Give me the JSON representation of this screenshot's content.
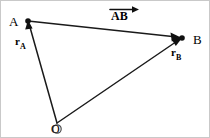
{
  "figure": {
    "type": "vector-diagram",
    "background_color": "#ffffff",
    "stroke_color": "#000000",
    "border_color": "#c9c9c9",
    "width": 210,
    "height": 138,
    "labels": {
      "point_a": "A",
      "point_b": "B",
      "origin": "O",
      "vector_ra_symbol": "r",
      "vector_ra_subscript": "A",
      "vector_rb_symbol": "r",
      "vector_rb_subscript": "B",
      "vector_ab": "AB"
    },
    "points": [
      {
        "name": "A",
        "label": "A",
        "x": 27,
        "y": 20,
        "marker": "filled-dot"
      },
      {
        "name": "B",
        "label": "B",
        "x": 181,
        "y": 37,
        "marker": "filled-dot"
      },
      {
        "name": "O",
        "label": "O",
        "x": 56,
        "y": 122,
        "marker": "open-circle"
      }
    ],
    "vectors": [
      {
        "name": "r_A",
        "label": "rA",
        "from": "O",
        "to": "A",
        "arrowhead": "at-end"
      },
      {
        "name": "r_B",
        "label": "rB",
        "from": "O",
        "to": "B",
        "arrowhead": "at-end"
      },
      {
        "name": "AB",
        "label": "AB",
        "from": "A",
        "to": "B",
        "arrowhead": "at-end"
      }
    ]
  }
}
